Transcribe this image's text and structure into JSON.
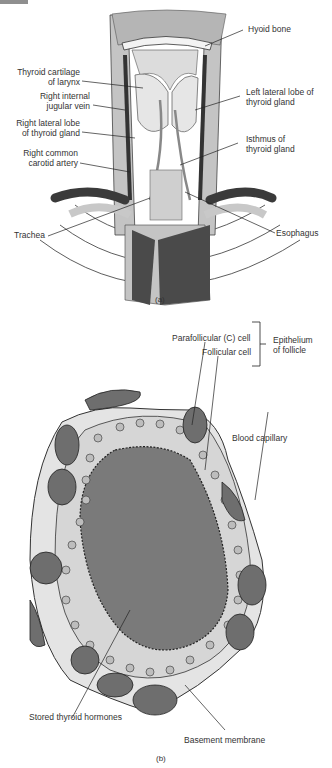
{
  "figure_a": {
    "caption": "(a)",
    "labels": {
      "hyoid_bone": "Hyoid bone",
      "thyroid_cartilage_1": "Thyroid cartilage",
      "thyroid_cartilage_2": "of larynx",
      "jugular_1": "Right internal",
      "jugular_2": "jugular vein",
      "right_lobe_1": "Right lateral lobe",
      "right_lobe_2": "of thyroid gland",
      "carotid_1": "Right common",
      "carotid_2": "carotid artery",
      "left_lobe_1": "Left lateral lobe of",
      "left_lobe_2": "thyroid gland",
      "isthmus_1": "Isthmus of",
      "isthmus_2": "thyroid gland",
      "trachea": "Trachea",
      "esophagus": "Esophagus"
    }
  },
  "figure_b": {
    "caption": "(b)",
    "labels": {
      "parafollicular": "Parafollicular (C) cell",
      "follicular": "Follicular cell",
      "epithelium_1": "Epithelium",
      "epithelium_2": "of follicle",
      "blood_capillary": "Blood capillary",
      "stored_hormones": "Stored thyroid hormones",
      "basement_membrane": "Basement membrane"
    }
  },
  "colors": {
    "light_gray": "#c4c4c4",
    "mid_gray": "#8a8a8a",
    "dark_gray": "#4a4a4a",
    "cell_fill": "#d9d9d9",
    "colloid": "#7a7a7a"
  }
}
